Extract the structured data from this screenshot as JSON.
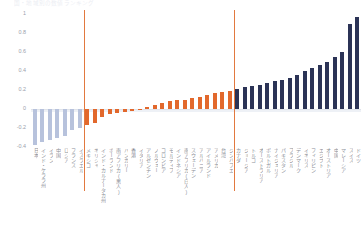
{
  "title": "国・地域別の数値ランキング",
  "axis": {
    "yticks": [
      "1",
      "0.8",
      "0.6",
      "0.4",
      "0.2",
      "0",
      "-0.2",
      "-0.4"
    ],
    "ymin": -0.4,
    "ymax": 1.0
  },
  "colors": {
    "negative": "#b7c2dc",
    "middle": "#e2682c",
    "positive": "#2b3356",
    "divider": "#e2793f",
    "zero_line": "#dfe3ea",
    "baseline_band": "#eef1f6",
    "label": "#8b8f98",
    "tick": "#9aa0ab"
  },
  "dividers": [
    {
      "after_index": 6
    },
    {
      "after_index": 26
    }
  ],
  "chart_data": {
    "type": "bar",
    "title": "国・地域別の数値ランキング",
    "xlabel": "",
    "ylabel": "",
    "ylim": [
      -0.4,
      1.0
    ],
    "grid": false,
    "legend": "none",
    "categories": [
      "日本",
      "インド・ケララ州",
      "イラン",
      "中国",
      "ロシア",
      "フランス",
      "イスラエル",
      "メキシコ",
      "ギリシャ",
      "インド・カルナータカ州",
      "ポーランド",
      "南アフリカ(黒人)",
      "ハンガリー",
      "香港",
      "イタリア",
      "アルゼンチン",
      "ノルウェー",
      "コロンビア",
      "モルディブ",
      "インドネシア",
      "南アフリカ(白人)",
      "スウェーデン",
      "アルバニア",
      "アイルランド",
      "アメリカ",
      "台湾",
      "ジンバブエ",
      "カナダ",
      "ジョージア",
      "トルコ",
      "オーストラリア",
      "ポルトガル",
      "ナイジェリア",
      "パキスタン",
      "ブラジル",
      "デンマーク",
      "イギリス",
      "フィリピン",
      "エジプト",
      "オーストリア",
      "中国",
      "マレーシア",
      "スイス",
      "ドイツ"
    ],
    "values": [
      -0.38,
      -0.35,
      -0.33,
      -0.31,
      -0.28,
      -0.22,
      -0.2,
      -0.17,
      -0.15,
      -0.08,
      -0.05,
      -0.04,
      -0.03,
      -0.02,
      -0.01,
      0.02,
      0.04,
      0.06,
      0.08,
      0.09,
      0.1,
      0.12,
      0.13,
      0.15,
      0.17,
      0.18,
      0.19,
      0.21,
      0.23,
      0.24,
      0.25,
      0.27,
      0.29,
      0.31,
      0.33,
      0.36,
      0.4,
      0.43,
      0.46,
      0.5,
      0.55,
      0.6,
      0.9,
      0.97
    ],
    "groups": [
      {
        "name": "negative",
        "range": [
          0,
          6
        ],
        "color": "#b7c2dc"
      },
      {
        "name": "middle",
        "range": [
          7,
          26
        ],
        "color": "#e2682c"
      },
      {
        "name": "positive",
        "range": [
          27,
          43
        ],
        "color": "#2b3356"
      }
    ]
  }
}
